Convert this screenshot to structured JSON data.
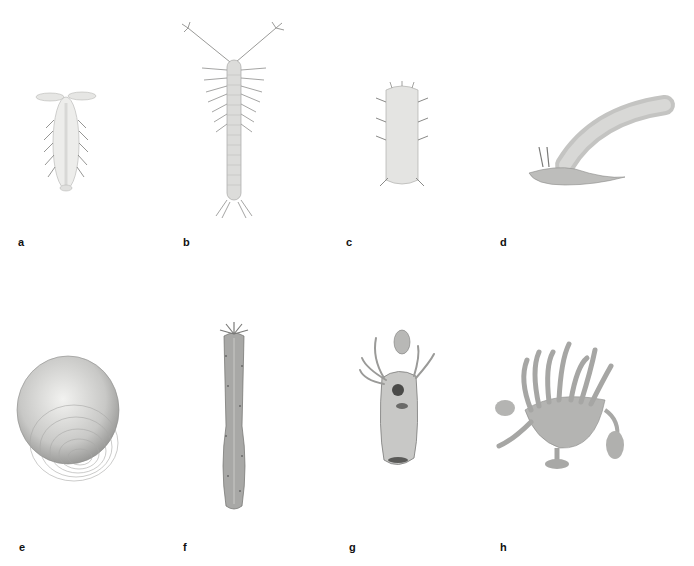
{
  "plate": {
    "background": "#ffffff",
    "panels": [
      {
        "label": "a",
        "subject": "isopod-like crustacean, dorsal view"
      },
      {
        "label": "b",
        "subject": "segmented crustacean with branched antennae"
      },
      {
        "label": "c",
        "subject": "tardigrade-like animal, dorsal view"
      },
      {
        "label": "d",
        "subject": "elongate tube-like animal with tentacles"
      },
      {
        "label": "e",
        "subject": "ribbed bivalve shell"
      },
      {
        "label": "f",
        "subject": "elongate sea cucumber with crown of tentacles"
      },
      {
        "label": "g",
        "subject": "sac-like larva with tentacles"
      },
      {
        "label": "h",
        "subject": "stalked polyp with curled tentacles"
      }
    ]
  },
  "colors": {
    "ink": "#111111",
    "light": "#e8e8e6",
    "mid": "#bdbdbb",
    "dark": "#7a7a78"
  }
}
